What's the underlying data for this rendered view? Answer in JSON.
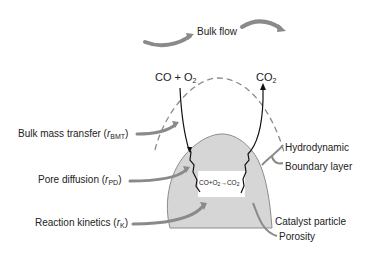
{
  "labels": {
    "bulk_flow": "Bulk flow",
    "reactant_co": "CO + O",
    "reactant_sub": "2",
    "product_co": "CO",
    "product_sub": "2",
    "bmt_text": "Bulk mass transfer (",
    "bmt_r": "r",
    "bmt_sub": "BMT",
    "pd_text": "Pore diffusion (",
    "pd_r": "r",
    "pd_sub": "PD",
    "rk_text": "Reaction kinetics (",
    "rk_r": "r",
    "rk_sub": "K",
    "close_paren": ")",
    "hydrodynamic": "Hydrodynamic",
    "boundary_layer": "Boundary layer",
    "catalyst_particle": "Catalyst particle",
    "porosity": "Porosity",
    "reaction_a": "CO+O",
    "reaction_a_sub": "2",
    "reaction_arrow": "→CO",
    "reaction_b_sub": "2"
  },
  "colors": {
    "arrow_gray": "#8a8a8a",
    "particle_fill": "#d6d6d6",
    "particle_edge": "#8c8c8c",
    "dashed": "#8a8a8a",
    "path_line": "#111111"
  }
}
